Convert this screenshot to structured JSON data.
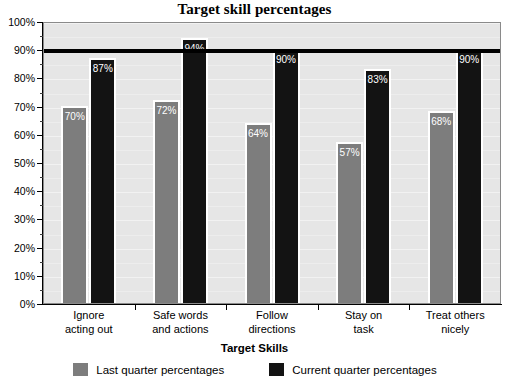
{
  "chart_data": {
    "type": "bar",
    "title": "Target skill percentages",
    "xlabel": "Target Skills",
    "ylabel": "",
    "ylim": [
      0,
      100
    ],
    "ytick_step": 10,
    "ytick_labels": [
      "0%",
      "10%",
      "20%",
      "30%",
      "40%",
      "50%",
      "60%",
      "70%",
      "80%",
      "90%",
      "100%"
    ],
    "grid": true,
    "legend_position": "bottom",
    "categories": [
      "Ignore acting out",
      "Safe words and actions",
      "Follow directions",
      "Stay on task",
      "Treat others nicely"
    ],
    "category_lines": [
      [
        "Ignore",
        "acting out"
      ],
      [
        "Safe words",
        "and actions"
      ],
      [
        "Follow",
        "directions"
      ],
      [
        "Stay on",
        "task"
      ],
      [
        "Treat others",
        "nicely"
      ]
    ],
    "series": [
      {
        "name": "Last quarter percentages",
        "color": "#7d7d7d",
        "values": [
          70,
          72,
          64,
          57,
          68
        ],
        "labels": [
          "70%",
          "72%",
          "64%",
          "57%",
          "68%"
        ]
      },
      {
        "name": "Current quarter percentages",
        "color": "#131313",
        "values": [
          87,
          94,
          90,
          83,
          90
        ],
        "labels": [
          "87%",
          "94%",
          "90%",
          "83%",
          "90%"
        ]
      }
    ],
    "annotations": [
      {
        "type": "hline",
        "value": 90,
        "label": "",
        "color": "#000000",
        "width": 4
      }
    ],
    "plot_background": "#e6e6e6"
  },
  "legend": {
    "items": [
      {
        "label": "Last quarter percentages",
        "color": "#7d7d7d"
      },
      {
        "label": "Current quarter percentages",
        "color": "#131313"
      }
    ]
  }
}
